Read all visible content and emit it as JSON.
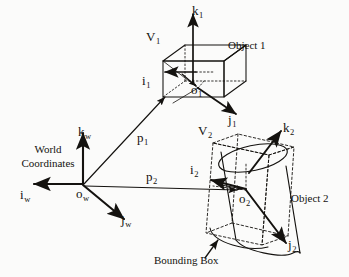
{
  "figure": {
    "kind": "3d-coordinate-frames-diagram",
    "background_color": "#fbfbfa",
    "ink_color": "#14120f",
    "world_frame": {
      "origin_label": "o",
      "origin_sub": "w",
      "axes": [
        {
          "name": "i-axis",
          "label": "i",
          "sub": "w"
        },
        {
          "name": "j-axis",
          "label": "j",
          "sub": "w"
        },
        {
          "name": "k-axis",
          "label": "k",
          "sub": "w"
        }
      ],
      "caption_line1": "World",
      "caption_line2": "Coordinates"
    },
    "object1": {
      "name_label": "Object 1",
      "volume_label": "V",
      "volume_sub": "1",
      "origin_label": "o",
      "origin_sub": "1",
      "shape": "box",
      "axes": [
        {
          "name": "i-axis",
          "label": "i",
          "sub": "1"
        },
        {
          "name": "j-axis",
          "label": "j",
          "sub": "1"
        },
        {
          "name": "k-axis",
          "label": "k",
          "sub": "1"
        }
      ]
    },
    "object2": {
      "name_label": "Object 2",
      "volume_label": "V",
      "volume_sub": "2",
      "origin_label": "o",
      "origin_sub": "2",
      "shape": "cylinder",
      "bounding_box_label": "Bounding Box",
      "axes": [
        {
          "name": "i-axis",
          "label": "i",
          "sub": "2"
        },
        {
          "name": "j-axis",
          "label": "j",
          "sub": "2"
        },
        {
          "name": "k-axis",
          "label": "k",
          "sub": "2"
        }
      ]
    },
    "vectors": [
      {
        "name": "p1",
        "label": "p",
        "sub": "1"
      },
      {
        "name": "p2",
        "label": "p",
        "sub": "2"
      }
    ]
  }
}
